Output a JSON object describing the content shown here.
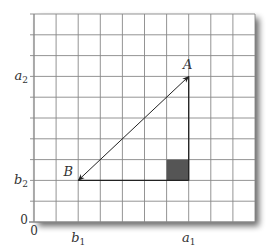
{
  "diagram": {
    "grid": {
      "cols": 10,
      "rows": 10
    },
    "origin_label_x": "0",
    "origin_label_y": "0",
    "x_ticks": [
      {
        "col": 2,
        "label": "b",
        "sub": "1"
      },
      {
        "col": 7,
        "label": "a",
        "sub": "1"
      }
    ],
    "y_ticks": [
      {
        "row": 7,
        "label": "a",
        "sub": "2"
      },
      {
        "row": 2,
        "label": "b",
        "sub": "2"
      }
    ],
    "points": {
      "A": {
        "label": "A",
        "col": 7,
        "row": 7
      },
      "B": {
        "label": "B",
        "col": 2,
        "row": 2
      }
    },
    "shaded_cell": {
      "col": 6,
      "row": 2,
      "color": "#555555"
    },
    "colors": {
      "grid": "#888888",
      "lines": "#222222",
      "background": "#ffffff",
      "shadow": "#999999"
    }
  }
}
